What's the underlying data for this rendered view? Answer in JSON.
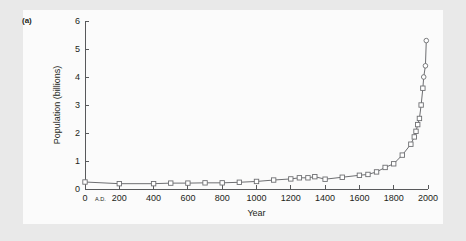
{
  "figure": {
    "panel_label": "(a)",
    "background_color": "#e9e9e9",
    "panel_color": "#fbfbfb",
    "line_color": "#6d6e71",
    "axis_color": "#58595b",
    "text_color": "#231f20"
  },
  "chart_data": {
    "type": "line",
    "title": "",
    "subtitle": "",
    "xlabel": "Year",
    "ylabel": "Population (billions)",
    "xlim": [
      0,
      2000
    ],
    "ylim": [
      0,
      6
    ],
    "xticks": [
      0,
      200,
      400,
      600,
      800,
      1000,
      1200,
      1400,
      1600,
      1800,
      2000
    ],
    "xtick_labels": [
      "0",
      "200",
      "400",
      "600",
      "800",
      "1000",
      "1200",
      "1400",
      "1600",
      "1800",
      "2000"
    ],
    "yticks": [
      0,
      1,
      2,
      3,
      4,
      5,
      6
    ],
    "ytick_labels": [
      "0",
      "1",
      "2",
      "3",
      "4",
      "5",
      "6"
    ],
    "grid": false,
    "legend": false,
    "annotations": [
      {
        "text": "A.D.",
        "x": 90,
        "y": -0.45,
        "note": "era marker next to year 0 on x-axis"
      }
    ],
    "marker_styles": {
      "square": "open square — data points up to about 3.6 billion",
      "circle": "open circle — highest/most recent data points above about 3.6 billion"
    },
    "series": [
      {
        "name": "World population",
        "marker": "open-square/open-circle",
        "x": [
          0,
          200,
          400,
          500,
          600,
          700,
          800,
          900,
          1000,
          1100,
          1200,
          1250,
          1300,
          1340,
          1400,
          1500,
          1600,
          1650,
          1700,
          1750,
          1800,
          1850,
          1900,
          1920,
          1930,
          1940,
          1950,
          1960,
          1970,
          1975,
          1985,
          1990
        ],
        "y": [
          0.25,
          0.19,
          0.19,
          0.21,
          0.21,
          0.22,
          0.22,
          0.24,
          0.27,
          0.32,
          0.36,
          0.4,
          0.4,
          0.44,
          0.35,
          0.42,
          0.49,
          0.52,
          0.61,
          0.77,
          0.9,
          1.21,
          1.6,
          1.86,
          2.06,
          2.3,
          2.52,
          3.0,
          3.6,
          4.0,
          4.4,
          5.3
        ]
      }
    ]
  }
}
